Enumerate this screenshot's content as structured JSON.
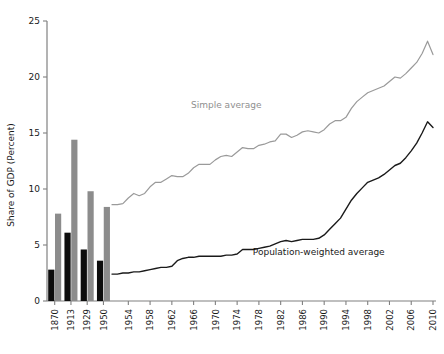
{
  "chart_data": {
    "type": "line",
    "title": "",
    "xlabel": "",
    "ylabel": "Share of GDP (Percent)",
    "ylim": [
      0,
      25
    ],
    "yticks": [
      0,
      5,
      10,
      15,
      20,
      25
    ],
    "grid": false,
    "legend_position": "inline-annotation",
    "annotations": [
      {
        "text": "Simple average",
        "x": 1972,
        "y": 17.2,
        "color": "#8f8f8f"
      },
      {
        "text": "Population-weighted average",
        "x": 1989,
        "y": 4.1,
        "color": "#1a1a1a"
      }
    ],
    "bar_section": {
      "categories": [
        "1870",
        "1913",
        "1929",
        "1950"
      ],
      "series": [
        {
          "name": "Population-weighted average",
          "color": "#0d0d0d",
          "values": [
            2.8,
            6.1,
            4.6,
            3.6
          ]
        },
        {
          "name": "Simple average",
          "color": "#8c8c8c",
          "values": [
            7.8,
            14.4,
            9.8,
            8.4
          ]
        }
      ]
    },
    "line_section": {
      "xticks": [
        1954,
        1958,
        1962,
        1966,
        1970,
        1974,
        1978,
        1982,
        1986,
        1990,
        1994,
        1998,
        2002,
        2006,
        2010
      ],
      "x": [
        1951,
        1952,
        1953,
        1954,
        1955,
        1956,
        1957,
        1958,
        1959,
        1960,
        1961,
        1962,
        1963,
        1964,
        1965,
        1966,
        1967,
        1968,
        1969,
        1970,
        1971,
        1972,
        1973,
        1974,
        1975,
        1976,
        1977,
        1978,
        1979,
        1980,
        1981,
        1982,
        1983,
        1984,
        1985,
        1986,
        1987,
        1988,
        1989,
        1990,
        1991,
        1992,
        1993,
        1994,
        1995,
        1996,
        1997,
        1998,
        1999,
        2000,
        2001,
        2002,
        2003,
        2004,
        2005,
        2006,
        2007,
        2008,
        2009,
        2010
      ],
      "series": [
        {
          "name": "Simple average",
          "color": "#9a9a9a",
          "values": [
            8.6,
            8.6,
            8.7,
            9.2,
            9.6,
            9.4,
            9.6,
            10.2,
            10.6,
            10.6,
            10.9,
            11.2,
            11.1,
            11.1,
            11.4,
            11.9,
            12.2,
            12.2,
            12.2,
            12.6,
            12.9,
            13.0,
            12.9,
            13.3,
            13.7,
            13.6,
            13.6,
            13.9,
            14.0,
            14.2,
            14.3,
            14.9,
            14.9,
            14.6,
            14.8,
            15.1,
            15.2,
            15.1,
            15.0,
            15.3,
            15.8,
            16.1,
            16.1,
            16.4,
            17.2,
            17.8,
            18.2,
            18.6,
            18.8,
            19.0,
            19.2,
            19.6,
            20.0,
            19.9,
            20.3,
            20.8,
            21.3,
            22.1,
            23.2,
            22.0
          ]
        },
        {
          "name": "Population-weighted average",
          "color": "#1a1a1a",
          "values": [
            2.4,
            2.4,
            2.5,
            2.5,
            2.6,
            2.6,
            2.7,
            2.8,
            2.9,
            3.0,
            3.0,
            3.1,
            3.6,
            3.8,
            3.9,
            3.9,
            4.0,
            4.0,
            4.0,
            4.0,
            4.0,
            4.1,
            4.1,
            4.2,
            4.6,
            4.6,
            4.6,
            4.7,
            4.8,
            4.9,
            5.1,
            5.3,
            5.4,
            5.3,
            5.4,
            5.5,
            5.5,
            5.5,
            5.6,
            5.9,
            6.4,
            6.9,
            7.4,
            8.2,
            9.0,
            9.6,
            10.1,
            10.6,
            10.8,
            11.0,
            11.3,
            11.7,
            12.1,
            12.3,
            12.8,
            13.4,
            14.1,
            15.0,
            16.0,
            15.5
          ]
        }
      ]
    }
  }
}
